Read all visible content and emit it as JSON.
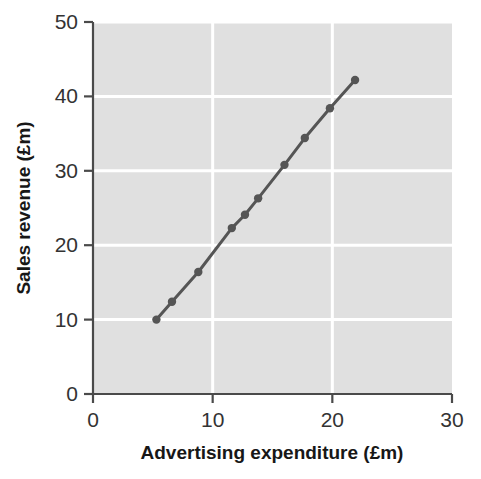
{
  "chart_data": {
    "type": "line",
    "title": "",
    "subtitle": "",
    "xlabel": "Advertising expenditure (£m)",
    "ylabel": "Sales revenue (£m)",
    "xlim": [
      0,
      30
    ],
    "ylim": [
      0,
      50
    ],
    "xticks": [
      0,
      10,
      20,
      30
    ],
    "yticks": [
      0,
      10,
      20,
      30,
      40,
      50
    ],
    "xtick_labels": [
      "0",
      "10",
      "20",
      "30"
    ],
    "ytick_labels": [
      "0",
      "10",
      "20",
      "30",
      "40",
      "50"
    ],
    "grid": true,
    "grid_color": "#ffffff",
    "plot_background": "#e0e0e0",
    "legend": false,
    "legend_position": "none",
    "series": [
      {
        "name": "Sales revenue vs advertising expenditure",
        "color": "#555555",
        "marker": "circle",
        "line_width": 3,
        "x": [
          5.3,
          6.6,
          8.8,
          11.6,
          12.7,
          13.8,
          16.0,
          17.7,
          19.8,
          21.9
        ],
        "y": [
          10.0,
          12.4,
          16.4,
          22.3,
          24.1,
          26.3,
          30.8,
          34.4,
          38.4,
          42.2
        ],
        "points": [
          {
            "x": 5.3,
            "y": 10.0
          },
          {
            "x": 6.6,
            "y": 12.4
          },
          {
            "x": 8.8,
            "y": 16.4
          },
          {
            "x": 11.6,
            "y": 22.3
          },
          {
            "x": 12.7,
            "y": 24.1
          },
          {
            "x": 13.8,
            "y": 26.3
          },
          {
            "x": 16.0,
            "y": 30.8
          },
          {
            "x": 17.7,
            "y": 34.4
          },
          {
            "x": 19.8,
            "y": 38.4
          },
          {
            "x": 21.9,
            "y": 42.2
          }
        ]
      }
    ],
    "annotations": []
  },
  "axes": {
    "x_title": "Advertising expenditure (£m)",
    "y_title": "Sales revenue (£m)",
    "axis_color": "#4a4a4a"
  }
}
